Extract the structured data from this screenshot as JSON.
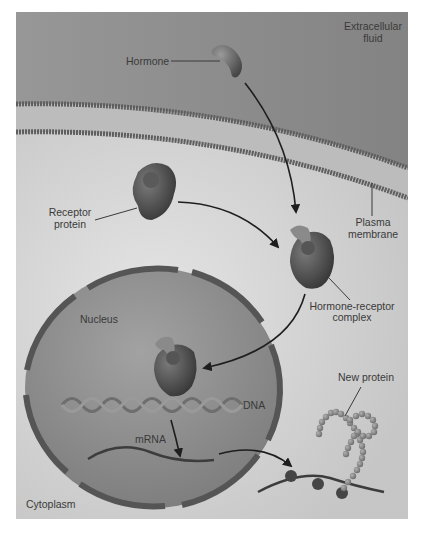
{
  "diagram": {
    "labels": {
      "extracellular_fluid": [
        "Extracellular",
        "fluid"
      ],
      "hormone": "Hormone",
      "receptor_protein": [
        "Receptor",
        "protein"
      ],
      "plasma_membrane": [
        "Plasma",
        "membrane"
      ],
      "hormone_receptor_complex": [
        "Hormone-receptor",
        "complex"
      ],
      "nucleus": "Nucleus",
      "dna": "DNA",
      "mrna": "mRNA",
      "new_protein": "New protein",
      "cytoplasm": "Cytoplasm"
    },
    "colors": {
      "extracellular": "#8e8e8e",
      "cytoplasm": "#d2d2d2",
      "membrane_line": "#5e5e5e",
      "membrane_interior": "#bdbdbd",
      "nucleus_fill": "#8a8a8a",
      "nuclear_envelope": "#555555",
      "protein_dark": "#3e3e3e",
      "arrow": "#1e1e1e",
      "bead": "#8c8c8c"
    },
    "flow": [
      "Hormone crosses plasma membrane",
      "Hormone binds receptor protein",
      "Hormone-receptor complex enters nucleus",
      "Complex binds DNA",
      "mRNA transcribed and exits nucleus",
      "Ribosomes translate mRNA into new protein"
    ]
  }
}
